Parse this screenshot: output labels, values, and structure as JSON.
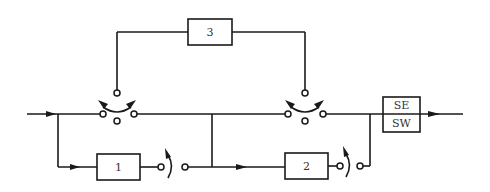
{
  "diagram": {
    "type": "block-diagram",
    "blocks": [
      {
        "id": "block-1",
        "label": "1"
      },
      {
        "id": "block-2",
        "label": "2"
      },
      {
        "id": "block-3",
        "label": "3"
      },
      {
        "id": "block-se-sw",
        "labels": [
          "SE",
          "SW"
        ]
      }
    ],
    "switches": [
      {
        "id": "changeover-switch-left",
        "kind": "three-way changeover switch"
      },
      {
        "id": "changeover-switch-right",
        "kind": "three-way changeover switch"
      },
      {
        "id": "switch-after-block-1",
        "kind": "single switch"
      },
      {
        "id": "switch-after-block-2",
        "kind": "single switch"
      }
    ],
    "edges": [
      {
        "from": "input",
        "to": "changeover-switch-left"
      },
      {
        "from": "input",
        "to": "block-1"
      },
      {
        "from": "changeover-switch-left",
        "to": "block-3"
      },
      {
        "from": "block-3",
        "to": "changeover-switch-right"
      },
      {
        "from": "block-1",
        "to": "switch-after-block-1"
      },
      {
        "from": "switch-after-block-1",
        "to": "block-2"
      },
      {
        "from": "changeover-switch-left",
        "to": "block-2"
      },
      {
        "from": "block-2",
        "to": "switch-after-block-2"
      },
      {
        "from": "switch-after-block-2",
        "to": "block-se-sw"
      },
      {
        "from": "changeover-switch-right",
        "to": "block-se-sw"
      },
      {
        "from": "block-se-sw",
        "to": "output"
      }
    ]
  },
  "labels": {
    "block1": "1",
    "block2": "2",
    "block3": "3",
    "se": "SE",
    "sw": "SW"
  },
  "colors": {
    "line": "#1a1a1a",
    "text": "#333333",
    "background": "#ffffff"
  }
}
